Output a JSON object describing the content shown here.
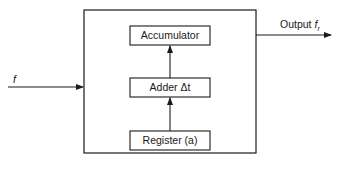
{
  "diagram": {
    "blocks": [
      {
        "id": "accumulator",
        "label": "Accumulator"
      },
      {
        "id": "adder",
        "label": "Adder Δt"
      },
      {
        "id": "register",
        "label": "Register (a)"
      }
    ],
    "input": {
      "label": "f"
    },
    "output": {
      "prefix": "Output ",
      "symbol": "f",
      "subscript": "r"
    },
    "colors": {
      "line": "#1a1a1a",
      "background": "#ffffff"
    }
  }
}
